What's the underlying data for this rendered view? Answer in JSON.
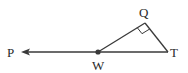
{
  "diagram": {
    "points": {
      "P": {
        "label": "P"
      },
      "W": {
        "label": "W"
      },
      "T": {
        "label": "T"
      },
      "Q": {
        "label": "Q"
      }
    },
    "segments": [
      {
        "from": "W",
        "to": "P",
        "type": "ray",
        "arrow_at": "P"
      },
      {
        "from": "W",
        "to": "T",
        "type": "segment"
      },
      {
        "from": "W",
        "to": "Q",
        "type": "segment"
      },
      {
        "from": "Q",
        "to": "T",
        "type": "segment"
      }
    ],
    "right_angle_at": "Q",
    "marked_point": "W",
    "line_color": "#3a3a3a"
  }
}
